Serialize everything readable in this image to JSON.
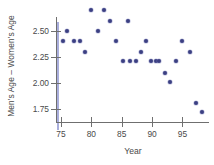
{
  "chart_data": {
    "type": "scatter",
    "title": "",
    "xlabel": "Year",
    "ylabel": "Men's Age – Women's Age",
    "xlim": [
      73.5,
      98.8
    ],
    "ylim": [
      1.66,
      2.78
    ],
    "xticks": [
      75,
      80,
      85,
      90,
      95
    ],
    "xtick_labels": [
      "75",
      "80",
      "85",
      "90",
      "95"
    ],
    "yticks": [
      2.5,
      2.25,
      2.0,
      1.75
    ],
    "ytick_labels": [
      "2.50",
      "2.25",
      "2.00",
      "1.75"
    ],
    "grid": false,
    "legend": null,
    "point_color": "#3b3f82",
    "axis_color": "#6f6f6f",
    "text_color": "#4a4a4a",
    "points": [
      {
        "x": 76.0,
        "y": 2.5
      },
      {
        "x": 75.4,
        "y": 2.4
      },
      {
        "x": 77.1,
        "y": 2.4
      },
      {
        "x": 78.1,
        "y": 2.4
      },
      {
        "x": 79.0,
        "y": 2.3
      },
      {
        "x": 80.0,
        "y": 2.7
      },
      {
        "x": 81.1,
        "y": 2.5
      },
      {
        "x": 82.1,
        "y": 2.7
      },
      {
        "x": 83.0,
        "y": 2.6
      },
      {
        "x": 84.1,
        "y": 2.4
      },
      {
        "x": 86.0,
        "y": 2.6
      },
      {
        "x": 85.2,
        "y": 2.21
      },
      {
        "x": 86.3,
        "y": 2.21
      },
      {
        "x": 87.4,
        "y": 2.21
      },
      {
        "x": 88.1,
        "y": 2.3
      },
      {
        "x": 89.0,
        "y": 2.4
      },
      {
        "x": 89.8,
        "y": 2.21
      },
      {
        "x": 90.6,
        "y": 2.21
      },
      {
        "x": 91.1,
        "y": 2.21
      },
      {
        "x": 92.1,
        "y": 2.1
      },
      {
        "x": 93.0,
        "y": 2.01
      },
      {
        "x": 94.0,
        "y": 2.21
      },
      {
        "x": 95.0,
        "y": 2.4
      },
      {
        "x": 96.2,
        "y": 2.3
      },
      {
        "x": 97.3,
        "y": 1.81
      },
      {
        "x": 98.2,
        "y": 1.72
      }
    ]
  }
}
